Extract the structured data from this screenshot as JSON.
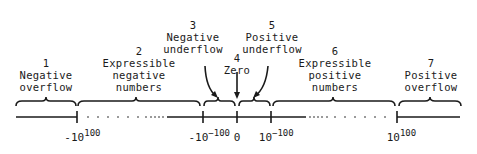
{
  "diagram": {
    "type": "number-line-regions",
    "regions": [
      {
        "num": "1",
        "lines": [
          "Negative",
          "overflow"
        ],
        "cx": 46,
        "top": 57
      },
      {
        "num": "2",
        "lines": [
          "Expressible",
          "negative",
          "numbers"
        ],
        "cx": 139,
        "top": 45
      },
      {
        "num": "3",
        "lines": [
          "Negative",
          "underflow"
        ],
        "cx": 193,
        "top": 19
      },
      {
        "num": "4",
        "lines": [
          "Zero"
        ],
        "cx": 237,
        "top": 52
      },
      {
        "num": "5",
        "lines": [
          "Positive",
          "underflow"
        ],
        "cx": 272,
        "top": 19
      },
      {
        "num": "6",
        "lines": [
          "Expressible",
          "positive",
          "numbers"
        ],
        "cx": 335,
        "top": 45
      },
      {
        "num": "7",
        "lines": [
          "Positive",
          "overflow"
        ],
        "cx": 431,
        "top": 57
      }
    ],
    "ticks": [
      {
        "base": "-10",
        "exp": "100",
        "x": 77
      },
      {
        "base": "-10",
        "exp": "−100",
        "x": 203
      },
      {
        "base": "0",
        "exp": "",
        "x": 237
      },
      {
        "base": "10",
        "exp": "−100",
        "x": 271
      },
      {
        "base": "10",
        "exp": "100",
        "x": 397
      }
    ],
    "colors": {
      "ink": "#1a1a1a",
      "background": "#ffffff"
    }
  }
}
